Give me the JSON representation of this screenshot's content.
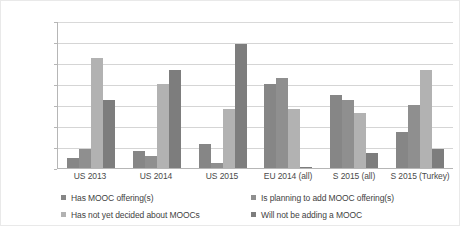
{
  "chart_data": {
    "type": "bar",
    "title": "",
    "xlabel": "",
    "ylabel": "",
    "ylim": [
      0,
      70
    ],
    "ytick_labels": [
      "70,0%",
      "60,0%",
      "50,0%",
      "40,0%",
      "30,0%",
      "20,0%",
      "10,0%",
      "0,0%"
    ],
    "ytick_values": [
      70,
      60,
      50,
      40,
      30,
      20,
      10,
      0
    ],
    "grid": true,
    "legend_position": "bottom",
    "categories": [
      "US 2013",
      "US 2014",
      "US 2015",
      "EU 2014 (all)",
      "S 2015 (all)",
      "S 2015 (Turkey)"
    ],
    "series": [
      {
        "name": "Has MOOC offering(s)",
        "color": "#868686",
        "values": [
          4.8,
          8.0,
          11.5,
          40.0,
          35.0,
          17.0
        ]
      },
      {
        "name": "Is planning to add MOOC offering(s)",
        "color": "#8f8f8f",
        "values": [
          9.2,
          5.5,
          2.5,
          43.0,
          32.5,
          30.0
        ]
      },
      {
        "name": "Has not yet decided about MOOCs",
        "color": "#b2b2b2",
        "values": [
          52.5,
          40.0,
          28.0,
          28.0,
          26.0,
          46.5
        ]
      },
      {
        "name": "Will not be adding a MOOC",
        "color": "#7d7d7d",
        "values": [
          32.5,
          46.5,
          59.0,
          0.6,
          7.0,
          9.0
        ]
      }
    ]
  }
}
